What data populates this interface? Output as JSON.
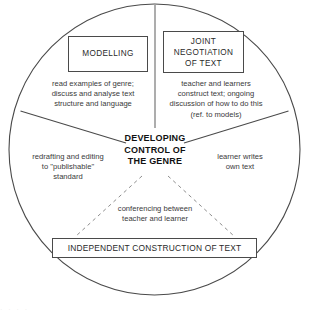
{
  "diagram": {
    "type": "cycle-diagram",
    "shape": "circle",
    "colors": {
      "stroke": "#4a4a4a",
      "text": "#2a2a2a",
      "caption_text": "#3a3a3a",
      "center_text": "#111111",
      "background": "#ffffff"
    },
    "center": {
      "line1": "DEVELOPING",
      "line2": "CONTROL OF",
      "line3": "THE GENRE"
    },
    "boxes": [
      {
        "id": "modelling",
        "label": "MODELLING"
      },
      {
        "id": "joint-negotiation",
        "line1": "JOINT",
        "line2": "NEGOTIATION",
        "line3": "OF TEXT"
      },
      {
        "id": "independent-construction",
        "label": "INDEPENDENT CONSTRUCTION OF TEXT"
      }
    ],
    "captions": {
      "modelling": {
        "line1": "read examples of genre;",
        "line2": "discuss and analyse text",
        "line3": "structure and language"
      },
      "joint_negotiation": {
        "line1": "teacher and learners",
        "line2": "construct text; ongoing",
        "line3": "discussion of how to do this",
        "line4": "(ref. to models)"
      },
      "redrafting": {
        "line1": "redrafting and editing",
        "line2": "to \"publishable\"",
        "line3": "standard"
      },
      "learner_writes": {
        "line1": "learner writes",
        "line2": "own text"
      },
      "conferencing": {
        "line1": "conferencing between",
        "line2": "teacher and learner"
      }
    },
    "artifact": {
      "bottom_strip": "·    ·        ·          ·"
    }
  }
}
